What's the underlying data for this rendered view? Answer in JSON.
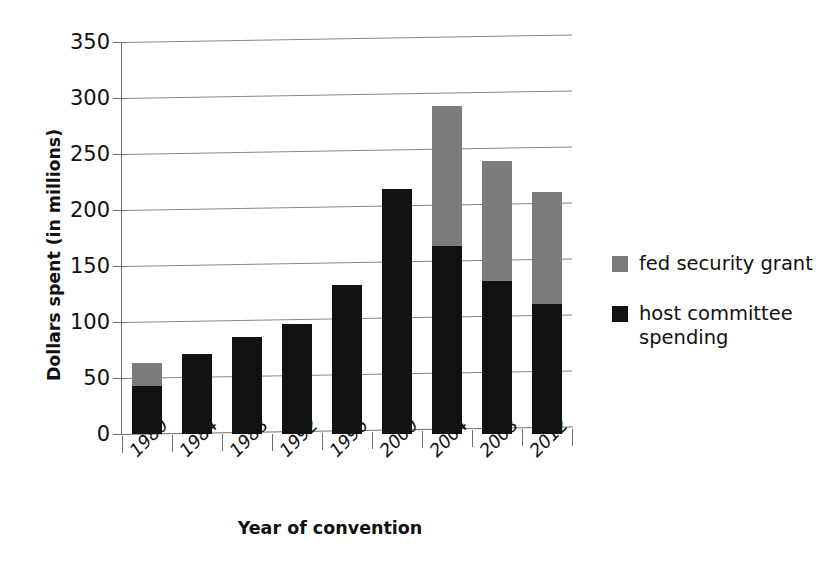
{
  "chart_data": {
    "type": "bar",
    "subtype": "stacked-vertical-bar",
    "title": "",
    "xlabel": "Year of convention",
    "ylabel": "Dollars spent (in millions)",
    "categories": [
      "1980",
      "1984",
      "1988",
      "1992",
      "1996",
      "2000",
      "2004",
      "2008",
      "2012"
    ],
    "series": [
      {
        "name": "host committee spending",
        "color": "#111111",
        "values": [
          43,
          71,
          87,
          98,
          133,
          219,
          168,
          137,
          116
        ]
      },
      {
        "name": "fed security grant",
        "color": "#7c7c7c",
        "values": [
          20,
          0,
          0,
          0,
          0,
          0,
          125,
          107,
          100
        ]
      }
    ],
    "totals": [
      63,
      71,
      87,
      98,
      133,
      219,
      293,
      244,
      216
    ],
    "stack_order": [
      "host committee spending",
      "fed security grant"
    ],
    "ylim": [
      0,
      350
    ],
    "yticks": [
      0,
      50,
      100,
      150,
      200,
      250,
      300,
      350
    ],
    "ytick_labels": [
      "0",
      "50",
      "100",
      "150",
      "200",
      "250",
      "300",
      "350"
    ],
    "grid": "horizontal",
    "legend_position": "right",
    "legend": [
      {
        "label": "fed security grant",
        "color": "#7c7c7c",
        "swatch": "gray-square-swatch"
      },
      {
        "label": "host committee\nspending",
        "color": "#111111",
        "swatch": "black-square-swatch"
      }
    ]
  }
}
